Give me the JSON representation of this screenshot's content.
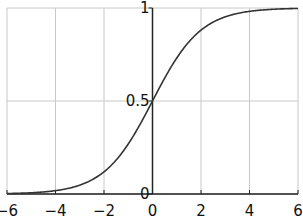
{
  "chart_data": {
    "type": "line",
    "title": "",
    "xlabel": "",
    "ylabel": "",
    "function": "sigmoid: 1/(1+e^-x)",
    "xlim": [
      -6,
      6
    ],
    "ylim": [
      0,
      1
    ],
    "grid": true,
    "legend": null,
    "x_ticks": [
      -6,
      -4,
      -2,
      0,
      2,
      4,
      6
    ],
    "x_tick_labels": [
      "−6",
      "−4",
      "−2",
      "0",
      "2",
      "4",
      "6"
    ],
    "y_ticks": [
      0,
      0.5,
      1
    ],
    "y_tick_labels": [
      "0",
      "0.5",
      "1"
    ],
    "series": [
      {
        "name": "sigmoid",
        "color": "#333333",
        "x": [
          -6,
          -5,
          -4,
          -3,
          -2,
          -1,
          0,
          1,
          2,
          3,
          4,
          5,
          6
        ],
        "y": [
          0.0025,
          0.0067,
          0.018,
          0.047,
          0.119,
          0.269,
          0.5,
          0.731,
          0.881,
          0.953,
          0.982,
          0.9933,
          0.9975
        ]
      }
    ]
  },
  "colors": {
    "grid": "#c8c8c8",
    "axis": "#222222",
    "curve": "#333333"
  }
}
